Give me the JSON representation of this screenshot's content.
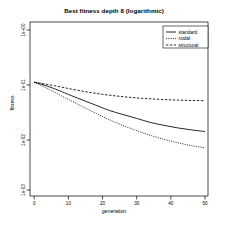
{
  "chart_data": {
    "type": "line",
    "title": "Best fitness depth 8 (logarithmic)",
    "xlabel": "generation",
    "ylabel": "fitness",
    "yscale": "log",
    "xlim": [
      0,
      52
    ],
    "ylim": [
      0.001,
      1.0
    ],
    "grid": false,
    "legend_position": "top-right",
    "xticks": [
      0,
      10,
      20,
      30,
      40,
      50
    ],
    "xtick_labels": [
      "0",
      "10",
      "20",
      "30",
      "40",
      "50"
    ],
    "yticks": [
      1.0,
      0.1,
      0.01,
      0.001
    ],
    "ytick_labels": [
      "1e+00",
      "1e-01",
      "1e-02",
      "1e-03"
    ],
    "x": [
      0,
      2,
      4,
      6,
      8,
      10,
      14,
      18,
      22,
      26,
      30,
      34,
      38,
      42,
      46,
      50
    ],
    "series": [
      {
        "name": "standard",
        "style": "solid",
        "values": [
          0.105,
          0.097,
          0.088,
          0.079,
          0.07,
          0.062,
          0.049,
          0.039,
          0.031,
          0.026,
          0.022,
          0.0185,
          0.0163,
          0.0146,
          0.0134,
          0.0125
        ]
      },
      {
        "name": "nodal",
        "style": "dotted",
        "values": [
          0.105,
          0.092,
          0.079,
          0.068,
          0.058,
          0.05,
          0.037,
          0.0275,
          0.0208,
          0.0162,
          0.013,
          0.0106,
          0.0089,
          0.0077,
          0.0068,
          0.0062
        ]
      },
      {
        "name": "structural",
        "style": "dashed",
        "values": [
          0.105,
          0.1,
          0.095,
          0.09,
          0.085,
          0.08,
          0.0715,
          0.065,
          0.06,
          0.0562,
          0.0533,
          0.0512,
          0.0496,
          0.0485,
          0.0478,
          0.0473
        ]
      }
    ],
    "legend_entries": [
      {
        "label": "standard",
        "style": "solid"
      },
      {
        "label": "nodal",
        "style": "dotted"
      },
      {
        "label": "structural",
        "style": "dashed"
      }
    ],
    "colors": {
      "axis": "#000000",
      "series": "#000000",
      "background": "#ffffff"
    }
  }
}
